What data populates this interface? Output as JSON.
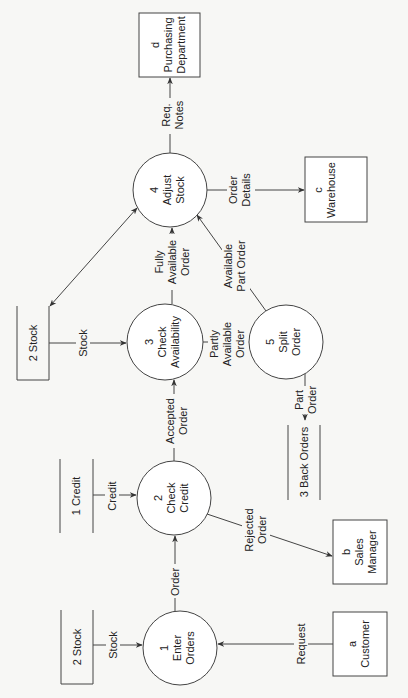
{
  "diagram": {
    "type": "data-flow-diagram",
    "orientation": "rotated-90-ccw",
    "colors": {
      "stroke": "#444444",
      "text": "#222222",
      "background": "#f7f7f5"
    },
    "external_entities": [
      {
        "id": "a",
        "label": "a",
        "name": "Customer"
      },
      {
        "id": "b",
        "label": "b",
        "name": "Sales Manager",
        "name_lines": [
          "Sales",
          "Manager"
        ]
      },
      {
        "id": "c",
        "label": "c",
        "name": "Warehouse"
      },
      {
        "id": "d",
        "label": "d",
        "name": "Purchasing Department",
        "name_lines": [
          "Purchasing",
          "Department"
        ]
      }
    ],
    "processes": [
      {
        "id": "1",
        "number": "1",
        "name_lines": [
          "Enter",
          "Orders"
        ]
      },
      {
        "id": "2",
        "number": "2",
        "name_lines": [
          "Check",
          "Credit"
        ]
      },
      {
        "id": "3",
        "number": "3",
        "name_lines": [
          "Check",
          "Availability"
        ]
      },
      {
        "id": "4",
        "number": "4",
        "name_lines": [
          "Adjust",
          "Stock"
        ]
      },
      {
        "id": "5",
        "number": "5",
        "name_lines": [
          "Split",
          "Order"
        ]
      }
    ],
    "data_stores": [
      {
        "id": "stock_bottom",
        "label": "2 Stock"
      },
      {
        "id": "credit",
        "label": "1 Credit"
      },
      {
        "id": "stock_top",
        "label": "2 Stock"
      },
      {
        "id": "back_orders",
        "label": "3 Back Orders"
      }
    ],
    "flows": [
      {
        "from": "a",
        "to": "1",
        "lines": [
          "Request"
        ]
      },
      {
        "from": "stock_bottom",
        "to": "1",
        "lines": [
          "Stock"
        ]
      },
      {
        "from": "1",
        "to": "2",
        "lines": [
          "Order"
        ]
      },
      {
        "from": "credit",
        "to": "2",
        "lines": [
          "Credit"
        ]
      },
      {
        "from": "2",
        "to": "b",
        "lines": [
          "Rejected",
          "Order"
        ]
      },
      {
        "from": "2",
        "to": "3",
        "lines": [
          "Accepted",
          "Order"
        ]
      },
      {
        "from": "stock_top",
        "to": "3",
        "lines": [
          "Stock"
        ]
      },
      {
        "from": "3",
        "to": "4",
        "lines": [
          "Fully",
          "Available",
          "Order"
        ]
      },
      {
        "from": "3",
        "to": "5",
        "lines": [
          "Partly",
          "Available",
          "Order"
        ]
      },
      {
        "from": "5",
        "to": "4",
        "lines": [
          "Available",
          "Part Order"
        ]
      },
      {
        "from": "5",
        "to": "back_orders",
        "lines": [
          "Part",
          "Order"
        ]
      },
      {
        "from": "4",
        "to": "stock_top",
        "lines": [],
        "bidirectional": true
      },
      {
        "from": "4",
        "to": "c",
        "lines": [
          "Order",
          "Details"
        ]
      },
      {
        "from": "4",
        "to": "d",
        "lines": [
          "Req.",
          "Notes"
        ]
      }
    ]
  }
}
